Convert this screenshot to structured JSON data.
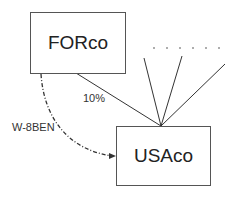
{
  "diagram": {
    "entities": [
      {
        "id": "forco",
        "label": "FORco"
      },
      {
        "id": "usaco",
        "label": "USAco"
      }
    ],
    "edges": [
      {
        "from": "forco",
        "to": "usaco",
        "label": "10%",
        "style": "solid"
      },
      {
        "from": "forco",
        "to": "usaco",
        "label": "W-8BEN",
        "style": "dash-dot arrow"
      }
    ],
    "other_owners_indicator": ". . . . . ."
  }
}
